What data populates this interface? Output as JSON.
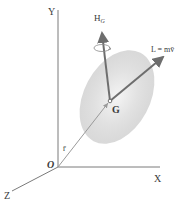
{
  "diagram": {
    "axes": {
      "x_label": "X",
      "y_label": "Y",
      "z_label": "Z",
      "origin_label": "O"
    },
    "points": {
      "mass_center_label": "G"
    },
    "vectors": {
      "position_label": "r̄",
      "angular_momentum_label_main": "H",
      "angular_momentum_label_sub": "G",
      "linear_momentum_label": "L = mv̄"
    },
    "colors": {
      "axis": "#7a7a7a",
      "vector": "#6e6e6e",
      "body": "#d9d9d9",
      "text": "#3a3a3a"
    }
  }
}
